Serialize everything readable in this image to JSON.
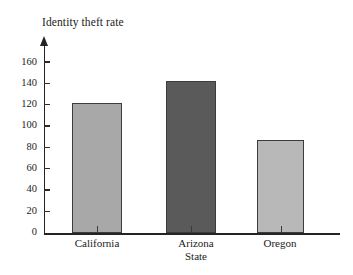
{
  "chart_data": {
    "type": "bar",
    "title": "Identity theft rate",
    "xlabel": "State",
    "ylabel": "",
    "categories": [
      "California",
      "Arizona",
      "Oregon"
    ],
    "values": [
      122,
      142,
      87
    ],
    "series": [
      {
        "name": "Identity theft rate",
        "values": [
          122,
          142,
          87
        ]
      }
    ],
    "ylim": [
      0,
      170
    ],
    "yticks": [
      0,
      20,
      40,
      60,
      80,
      100,
      120,
      140,
      160
    ],
    "ytick_labels": [
      "0",
      "20",
      "40",
      "60",
      "80",
      "100",
      "120",
      "140",
      "160"
    ],
    "grid": false,
    "legend": false,
    "bar_colors": [
      "#a8a8a8",
      "#5a5a5a",
      "#b8b8b8"
    ],
    "bar_edge_color": "#3c3c3c",
    "axis_color": "#242424",
    "background": "#ffffff",
    "y_axis_arrow": true
  },
  "axis": {
    "y_arrow_icon": "arrow-up-icon"
  }
}
